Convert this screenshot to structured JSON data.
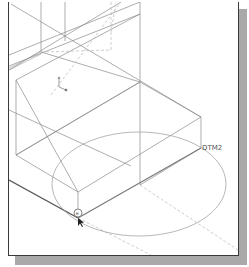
{
  "viewport": {
    "datum_label": "DTM2",
    "snap_symbol": "⊕",
    "colors": {
      "wire": "#8a8a8a",
      "wire_dark": "#555555",
      "hidden": "#b8b8b8",
      "frame": "#3a3a3a",
      "shadow": "#a9a9a9"
    }
  }
}
